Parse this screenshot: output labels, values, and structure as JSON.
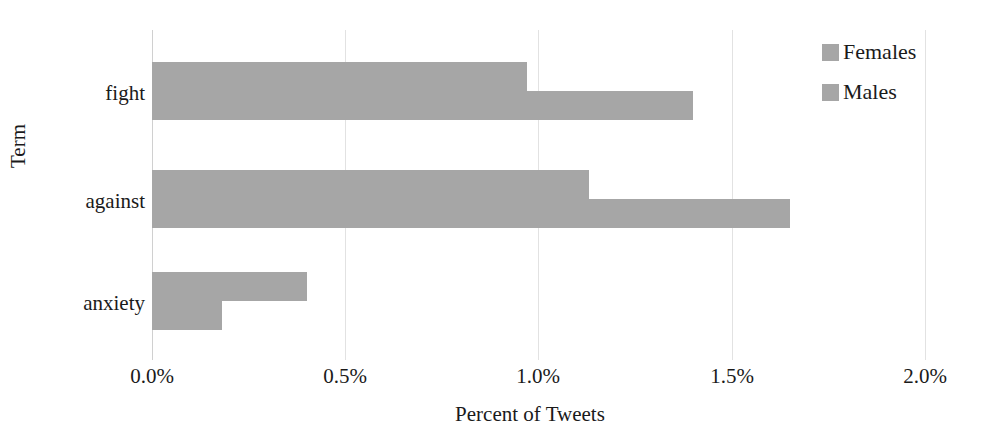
{
  "chart_data": {
    "type": "bar",
    "orientation": "horizontal",
    "title": "",
    "xlabel": "Percent of Tweets",
    "ylabel": "Term",
    "categories": [
      "fight",
      "against",
      "anxiety"
    ],
    "series": [
      {
        "name": "Females",
        "color": "#a6a6a6",
        "values": [
          0.97,
          1.13,
          0.4
        ]
      },
      {
        "name": "Males",
        "color": "#a6a6a6",
        "values": [
          1.4,
          1.65,
          0.18
        ]
      }
    ],
    "xlim": [
      0,
      2.0
    ],
    "xticks": [
      "0.0%",
      "0.5%",
      "1.0%",
      "1.5%",
      "2.0%"
    ],
    "xtick_values": [
      0,
      0.5,
      1.0,
      1.5,
      2.0
    ],
    "grid": true,
    "legend_position": "top-right",
    "value_suffix": "%"
  },
  "legend": {
    "items": [
      {
        "label": "Females",
        "color": "#a6a6a6"
      },
      {
        "label": "Males",
        "color": "#a6a6a6"
      }
    ]
  },
  "axes": {
    "x_title": "Percent of Tweets",
    "y_title": "Term"
  }
}
